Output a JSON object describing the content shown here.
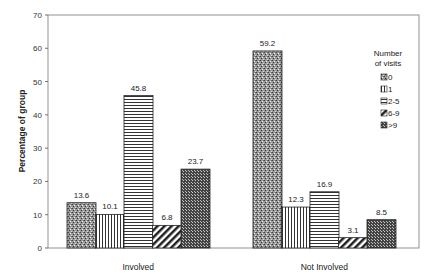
{
  "chart_data": {
    "type": "bar",
    "title": "",
    "xlabel": "",
    "ylabel": "Percentage of group",
    "ylim": [
      0,
      70
    ],
    "yticks": [
      0,
      10,
      20,
      30,
      40,
      50,
      60,
      70
    ],
    "grid": false,
    "categories": [
      "Involved",
      "Not Involved"
    ],
    "legend_title": "Number of visits",
    "legend_position": "upper right (inside plot)",
    "series": [
      {
        "name": "0",
        "values": [
          13.6,
          59.2
        ],
        "pattern": "stipple"
      },
      {
        "name": "1",
        "values": [
          10.1,
          12.3
        ],
        "pattern": "vertical"
      },
      {
        "name": "2-5",
        "values": [
          45.8,
          16.9
        ],
        "pattern": "horizontal"
      },
      {
        "name": "6-9",
        "values": [
          6.8,
          3.1
        ],
        "pattern": "diagonal"
      },
      {
        "name": ">9",
        "values": [
          23.7,
          8.5
        ],
        "pattern": "checker"
      }
    ]
  }
}
